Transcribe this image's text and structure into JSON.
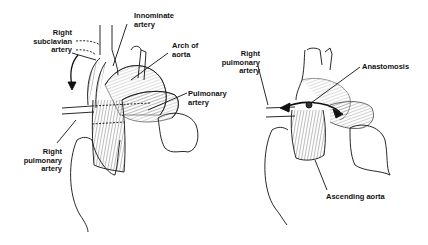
{
  "figure": {
    "left_panel": {
      "labels": {
        "right_subclavian_artery": [
          "Right",
          "subclavian",
          "artery"
        ],
        "innominate_artery": [
          "Innominate",
          "artery"
        ],
        "arch_of_aorta": [
          "Arch of",
          "aorta"
        ],
        "pulmonary_artery": [
          "Pulmonary",
          "artery"
        ],
        "right_pulmonary_artery": [
          "Right",
          "pulmonary",
          "artery"
        ]
      }
    },
    "right_panel": {
      "labels": {
        "right_pulmonary_artery": [
          "Right",
          "pulmonary",
          "artery"
        ],
        "anastomosis": "Anastomosis",
        "ascending_aorta": "Ascending aorta"
      }
    },
    "colors": {
      "ink": "#111111",
      "background": "#ffffff"
    }
  }
}
